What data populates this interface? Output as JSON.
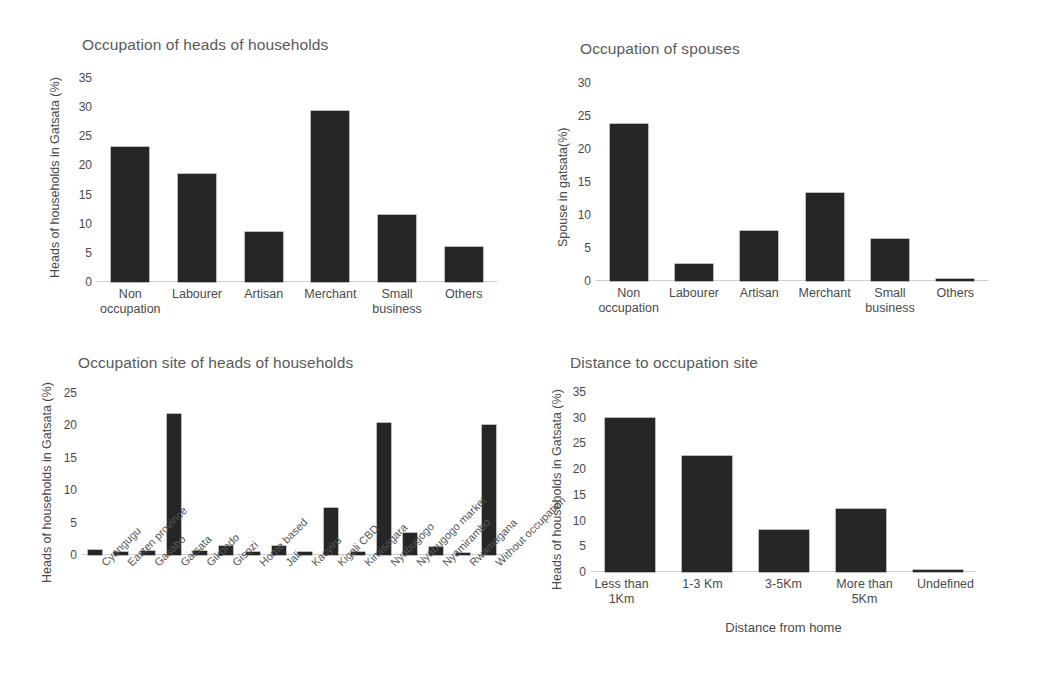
{
  "page": {
    "background": "#ffffff",
    "bar_color": "#262626",
    "text_color": "#4a4a4a",
    "title_color": "#595959"
  },
  "chart_data": [
    {
      "id": "occupation-heads",
      "type": "bar",
      "title": "Occupation of heads of households",
      "xlabel": "",
      "ylabel": "Heads of households in Gatsata (%)",
      "categories": [
        "Non\noccupation",
        "Labourer",
        "Artisan",
        "Merchant",
        "Small\nbusiness",
        "Others"
      ],
      "values": [
        23.2,
        18.6,
        8.5,
        29.4,
        11.5,
        6.0
      ],
      "ylim": [
        0,
        35
      ],
      "yticks": [
        0,
        5,
        10,
        15,
        20,
        25,
        30,
        35
      ],
      "ticklabels": [
        "0",
        "5",
        "10",
        "15",
        "20",
        "25",
        "30",
        "35"
      ],
      "grid": false,
      "legend": "none"
    },
    {
      "id": "occupation-spouses",
      "type": "bar",
      "title": "Occupation of spouses",
      "xlabel": "",
      "ylabel": "Spouse in gatsata(%)",
      "categories": [
        "Non\noccupation",
        "Labourer",
        "Artisan",
        "Merchant",
        "Small\nbusiness",
        "Others"
      ],
      "values": [
        23.8,
        2.6,
        7.6,
        13.4,
        6.4,
        0.3
      ],
      "ylim": [
        0,
        30
      ],
      "yticks": [
        0,
        5,
        10,
        15,
        20,
        25,
        30
      ],
      "ticklabels": [
        "0",
        "5",
        "10",
        "15",
        "20",
        "25",
        "30"
      ],
      "grid": false,
      "legend": "none"
    },
    {
      "id": "occupation-site",
      "type": "bar",
      "title": "Occupation site of heads of households",
      "xlabel": "",
      "ylabel": "Heads of households in Gatsata (%)",
      "categories": [
        "Cyangugu",
        "Easten province",
        "Gasabo",
        "Gatsata",
        "Gikondo",
        "Gisozi",
        "Home based",
        "Jali",
        "Kacyiru",
        "Kigali CBD",
        "Kimisagara",
        "Nyabugogo",
        "Nyabugogo market",
        "Nyamirambo",
        "Rwamagana",
        "Without occupation"
      ],
      "values": [
        0.7,
        0.5,
        0.6,
        21.8,
        0.6,
        1.4,
        0.5,
        1.4,
        0.5,
        7.3,
        0.4,
        20.3,
        3.4,
        1.2,
        0.3,
        20.1
      ],
      "ylim": [
        0,
        25
      ],
      "yticks": [
        0,
        5,
        10,
        15,
        20,
        25
      ],
      "ticklabels": [
        "0",
        "5",
        "10",
        "15",
        "20",
        "25"
      ],
      "grid": false,
      "legend": "none"
    },
    {
      "id": "distance-to-site",
      "type": "bar",
      "title": "Distance to occupation site",
      "xlabel": "Distance from home",
      "ylabel": "Heads of households in Gatsata (%)",
      "categories": [
        "Less than\n1Km",
        "1-3 Km",
        "3-5Km",
        "More than\n5Km",
        "Undefined"
      ],
      "values": [
        29.9,
        22.5,
        8.2,
        12.2,
        0.2
      ],
      "ylim": [
        0,
        35
      ],
      "yticks": [
        0,
        5,
        10,
        15,
        20,
        25,
        30,
        35
      ],
      "ticklabels": [
        "0",
        "5",
        "10",
        "15",
        "20",
        "25",
        "30",
        "35"
      ],
      "grid": false,
      "legend": "none"
    }
  ]
}
